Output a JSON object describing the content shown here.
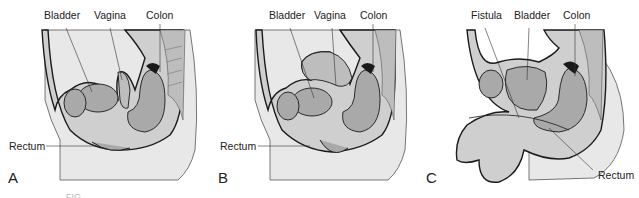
{
  "figure": {
    "panels": [
      {
        "letter": "A",
        "labels": {
          "bladder": "Bladder",
          "vagina": "Vagina",
          "colon": "Colon",
          "rectum": "Rectum"
        }
      },
      {
        "letter": "B",
        "labels": {
          "bladder": "Bladder",
          "vagina": "Vagina",
          "colon": "Colon",
          "rectum": "Rectum"
        }
      },
      {
        "letter": "C",
        "labels": {
          "fistula": "Fistula",
          "bladder": "Bladder",
          "colon": "Colon",
          "rectum": "Rectum"
        }
      }
    ],
    "caption": "FIG. ..."
  },
  "colors": {
    "tissue_fill": "#cfcfcf",
    "organ_fill": "#a9a9a9",
    "skin_fill": "#e8e8e8",
    "outline": "#1a1a1a",
    "text": "#222222"
  }
}
